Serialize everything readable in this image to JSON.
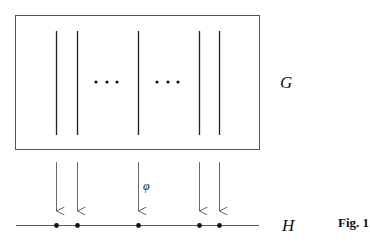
{
  "diagram": {
    "group_label": "G",
    "target_label": "H",
    "map_label": "φ",
    "figure_caption": "Fig. 1",
    "ellipsis_groups": 2,
    "fibers": [
      {
        "id": 1
      },
      {
        "id": 2
      },
      {
        "id": 3
      },
      {
        "id": 4
      },
      {
        "id": 5
      }
    ],
    "ellipsis_positions": [
      "between-fiber-2-and-3",
      "between-fiber-3-and-4"
    ]
  }
}
